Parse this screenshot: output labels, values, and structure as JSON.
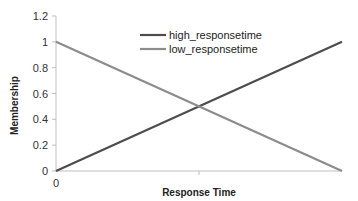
{
  "chart_data": {
    "type": "line",
    "title": "",
    "xlabel": "Response Time",
    "ylabel": "Membership",
    "x": [
      0,
      1
    ],
    "x_tick_labels": [
      "0"
    ],
    "x_mid_tick": true,
    "ylim": [
      0,
      1.2
    ],
    "y_ticks": [
      0,
      0.2,
      0.4,
      0.6,
      0.8,
      1,
      1.2
    ],
    "y_tick_labels": [
      "0",
      "0.2",
      "0.4",
      "0.6",
      "0.8",
      "1",
      "1.2"
    ],
    "grid": false,
    "legend_position": "top-center",
    "series": [
      {
        "name": "high_responsetime",
        "values": [
          0,
          1
        ],
        "color": "#4d4d4d"
      },
      {
        "name": "low_responsetime",
        "values": [
          1,
          0
        ],
        "color": "#8c8c8c"
      }
    ]
  }
}
